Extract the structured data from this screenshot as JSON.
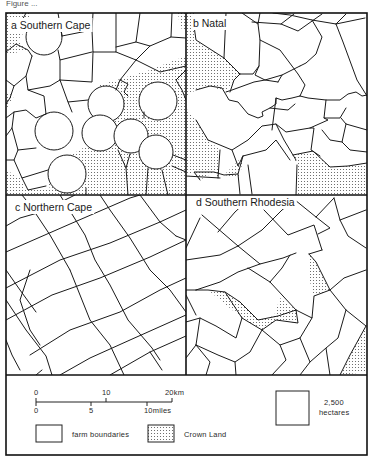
{
  "figure": {
    "caption_fragment": "Figure ... ",
    "panels": [
      {
        "id": "a",
        "label": "a Southern Cape"
      },
      {
        "id": "b",
        "label": "b Natal"
      },
      {
        "id": "c",
        "label": "c Northern Cape"
      },
      {
        "id": "d",
        "label": "d Southern Rhodesia"
      }
    ],
    "legend": {
      "scale_km": {
        "ticks": [
          "0",
          "10",
          "20km"
        ]
      },
      "scale_miles": {
        "ticks": [
          "0",
          "5",
          "10miles"
        ]
      },
      "items": [
        {
          "symbol": "empty-box",
          "label": "farm boundaries"
        },
        {
          "symbol": "stippled-box",
          "label": "Crown Land"
        }
      ],
      "area_reference": {
        "line1": "2,500",
        "line2": "hectares"
      }
    },
    "colors": {
      "line": "#1a1a1a",
      "stipple": "#555555",
      "background": "#ffffff"
    }
  }
}
